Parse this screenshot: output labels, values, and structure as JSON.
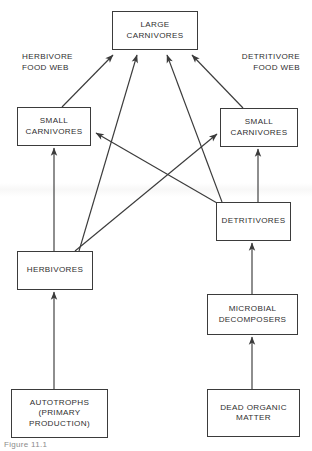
{
  "diagram": {
    "type": "flowchart",
    "background_color": "#ffffff",
    "line_color": "#3b3b3b",
    "text_color": "#2f2f2f",
    "caption": "Figure 11.1",
    "side_labels": {
      "left": "HERBIVORE\nFOOD WEB",
      "right": "DETRITIVORE\nFOOD WEB"
    },
    "nodes": {
      "large_carnivores": "LARGE\nCARNIVORES",
      "small_carnivores_left": "SMALL\nCARNIVORES",
      "small_carnivores_right": "SMALL\nCARNIVORES",
      "herbivores": "HERBIVORES",
      "detritivores": "DETRITIVORES",
      "microbial_decomposers": "MICROBIAL\nDECOMPOSERS",
      "autotrophs": "AUTOTROPHS\n(PRIMARY\nPRODUCTION)",
      "dead_organic_matter": "DEAD ORGANIC\nMATTER"
    },
    "edges": [
      {
        "from": "autotrophs",
        "to": "herbivores"
      },
      {
        "from": "herbivores",
        "to": "small_carnivores_left"
      },
      {
        "from": "herbivores",
        "to": "small_carnivores_right"
      },
      {
        "from": "herbivores",
        "to": "large_carnivores"
      },
      {
        "from": "small_carnivores_left",
        "to": "large_carnivores"
      },
      {
        "from": "dead_organic_matter",
        "to": "microbial_decomposers"
      },
      {
        "from": "microbial_decomposers",
        "to": "detritivores"
      },
      {
        "from": "detritivores",
        "to": "small_carnivores_right"
      },
      {
        "from": "detritivores",
        "to": "small_carnivores_left"
      },
      {
        "from": "detritivores",
        "to": "large_carnivores"
      },
      {
        "from": "small_carnivores_right",
        "to": "large_carnivores"
      }
    ]
  }
}
